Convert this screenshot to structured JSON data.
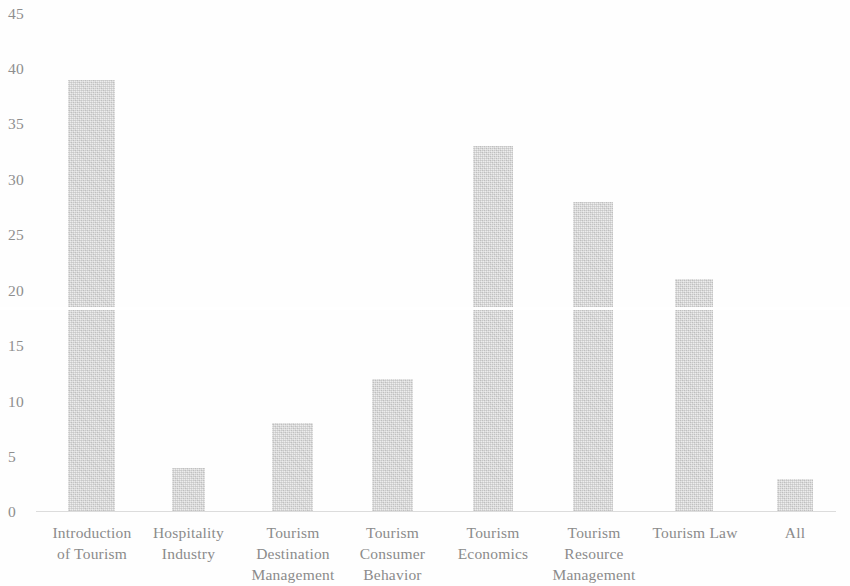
{
  "chart_data": {
    "type": "bar",
    "title": "",
    "xlabel": "",
    "ylabel": "",
    "ylim": [
      0,
      45
    ],
    "grid": false,
    "legend": null,
    "bar_color": "#d2d2d2",
    "categories": [
      "Introduction\nof Tourism",
      "Hospitality\nIndustry",
      "Tourism\nDestination\nManagement",
      "Tourism\nConsumer\nBehavior",
      "Tourism\nEconomics",
      "Tourism\nResource\nManagement",
      "Tourism Law",
      "All"
    ],
    "values": [
      39,
      4,
      8,
      12,
      33,
      28,
      21,
      3
    ],
    "y_ticks": [
      "0",
      "5",
      "10",
      "15",
      "20",
      "25",
      "30",
      "35",
      "40",
      "45"
    ],
    "y_tick_values": [
      0,
      5,
      10,
      15,
      20,
      25,
      30,
      35,
      40,
      45
    ]
  }
}
